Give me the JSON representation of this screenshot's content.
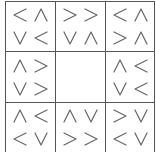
{
  "puzzle": {
    "type": "directional-arrow-grid",
    "rows": 3,
    "cols": 3,
    "line_color": "#555555",
    "glyph_color": "#666666",
    "cells": [
      [
        {
          "glyphs": [
            "left",
            "up",
            "down",
            "left"
          ]
        },
        {
          "glyphs": [
            "right",
            "right",
            "down",
            "up"
          ]
        },
        {
          "glyphs": [
            "left",
            "up",
            "right",
            "up"
          ]
        }
      ],
      [
        {
          "glyphs": [
            "up",
            "right",
            "down",
            "right"
          ]
        },
        {
          "glyphs": []
        },
        {
          "glyphs": [
            "up",
            "left",
            "down",
            "left"
          ]
        }
      ],
      [
        {
          "glyphs": [
            "up",
            "left",
            "left",
            "down"
          ]
        },
        {
          "glyphs": [
            "up",
            "down",
            "right",
            "right"
          ]
        },
        {
          "glyphs": [
            "right",
            "down",
            "left",
            "down"
          ]
        }
      ]
    ]
  },
  "glyph_chars": {
    "left": "<",
    "right": ">",
    "up": "∧",
    "down": "∨"
  }
}
